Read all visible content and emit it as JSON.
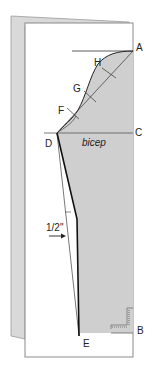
{
  "diagram": {
    "type": "sleeve-pattern-draft",
    "colors": {
      "background": "#ffffff",
      "back_page": "#d9d9d9",
      "paper_border": "#8a8a8a",
      "sleeve_fill": "#cfcfcf",
      "line": "#333333",
      "heavy_line": "#111111"
    },
    "points": {
      "A": "A",
      "B": "B",
      "C": "C",
      "D": "D",
      "E": "E",
      "F": "F",
      "G": "G",
      "H": "H"
    },
    "labels": {
      "bicep": "bicep",
      "measurement": "1/2\""
    }
  }
}
